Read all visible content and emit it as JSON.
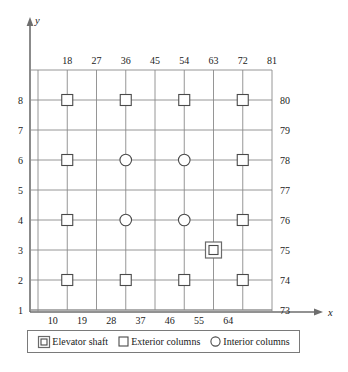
{
  "figure": {
    "axis_x_label": "x",
    "axis_y_label": "y"
  },
  "axes": {
    "top_tick_labels": [
      "18",
      "27",
      "36",
      "45",
      "54",
      "63",
      "72",
      "81"
    ],
    "bottom_tick_labels": [
      "10",
      "19",
      "28",
      "37",
      "46",
      "55",
      "64"
    ],
    "left_tick_labels": [
      "8",
      "7",
      "6",
      "5",
      "4",
      "3",
      "2",
      "1"
    ],
    "right_tick_labels": [
      "80",
      "79",
      "78",
      "77",
      "76",
      "75",
      "74",
      "73"
    ]
  },
  "legend": {
    "items": [
      {
        "icon": "double-square-icon",
        "label": "Elevator shaft"
      },
      {
        "icon": "square-icon",
        "label": "Exterior columns"
      },
      {
        "icon": "circle-icon",
        "label": "Interior columns"
      }
    ]
  },
  "chart_data": {
    "type": "scatter",
    "title": "",
    "xlabel": "x",
    "ylabel": "y",
    "grid": true,
    "legend_position": "bottom",
    "x_top_ticks": [
      18,
      27,
      36,
      45,
      54,
      63,
      72,
      81
    ],
    "x_bottom_ticks": [
      10,
      19,
      28,
      37,
      46,
      55,
      64
    ],
    "y_left_ticks": [
      8,
      7,
      6,
      5,
      4,
      3,
      2,
      1
    ],
    "y_right_ticks": [
      80,
      79,
      78,
      77,
      76,
      75,
      74,
      73
    ],
    "colors": {
      "grid": "#8a8a8a",
      "axis": "#6e6e6e",
      "marker": "#4a4a4a"
    },
    "series": [
      {
        "name": "Exterior columns",
        "marker": "square",
        "points": [
          {
            "col": 18,
            "row": 8,
            "row_right": 80
          },
          {
            "col": 36,
            "row": 8,
            "row_right": 80
          },
          {
            "col": 54,
            "row": 8,
            "row_right": 80
          },
          {
            "col": 72,
            "row": 8,
            "row_right": 80
          },
          {
            "col": 18,
            "row": 6,
            "row_right": 78
          },
          {
            "col": 72,
            "row": 6,
            "row_right": 78
          },
          {
            "col": 18,
            "row": 4,
            "row_right": 76
          },
          {
            "col": 72,
            "row": 4,
            "row_right": 76
          },
          {
            "col": 18,
            "row": 2,
            "row_right": 74
          },
          {
            "col": 36,
            "row": 2,
            "row_right": 74
          },
          {
            "col": 54,
            "row": 2,
            "row_right": 74
          },
          {
            "col": 72,
            "row": 2,
            "row_right": 74
          }
        ]
      },
      {
        "name": "Interior columns",
        "marker": "circle",
        "points": [
          {
            "col": 36,
            "row": 6,
            "row_right": 78
          },
          {
            "col": 54,
            "row": 6,
            "row_right": 78
          },
          {
            "col": 36,
            "row": 4,
            "row_right": 76
          },
          {
            "col": 54,
            "row": 4,
            "row_right": 76
          }
        ]
      },
      {
        "name": "Elevator shaft",
        "marker": "double-square",
        "points": [
          {
            "col": 63,
            "row": 3,
            "row_right": 75
          }
        ]
      }
    ]
  }
}
